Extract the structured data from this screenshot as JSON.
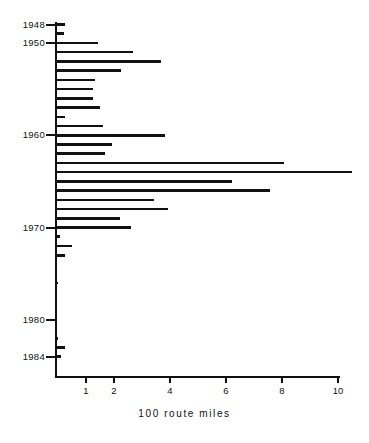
{
  "chart_data": {
    "type": "bar",
    "orientation": "horizontal",
    "title": "",
    "xlabel": "100 route miles",
    "ylabel": "",
    "xlim": [
      0,
      10.6
    ],
    "ylim": [
      1947.4,
      1984.8
    ],
    "grid": false,
    "legend": null,
    "x_ticks": [
      1,
      2,
      4,
      6,
      8,
      10
    ],
    "x_tick_labels": [
      "1",
      "2",
      "4",
      "6",
      "8",
      "10"
    ],
    "y_ticks": [
      1948,
      1950,
      1960,
      1970,
      1980,
      1984
    ],
    "y_tick_labels": [
      "1948",
      "1950",
      "1960",
      "1970",
      "1980",
      "1984"
    ],
    "categories": [
      1948,
      1949,
      1950,
      1951,
      1952,
      1953,
      1954,
      1955,
      1956,
      1957,
      1958,
      1959,
      1960,
      1961,
      1962,
      1963,
      1964,
      1965,
      1966,
      1967,
      1968,
      1969,
      1970,
      1971,
      1972,
      1973,
      1974,
      1975,
      1976,
      1977,
      1978,
      1979,
      1980,
      1981,
      1982,
      1983,
      1984
    ],
    "values": [
      0.3,
      0.25,
      1.45,
      2.7,
      3.7,
      2.3,
      1.35,
      1.3,
      1.3,
      1.55,
      0.3,
      1.65,
      3.85,
      1.95,
      1.7,
      8.1,
      10.55,
      6.25,
      7.6,
      3.45,
      3.95,
      2.25,
      2.65,
      0.1,
      0.55,
      0.3,
      0.0,
      0.0,
      0.05,
      0.0,
      0.0,
      0.0,
      0.0,
      0.0,
      0.05,
      0.3,
      0.15
    ],
    "series_name": "route miles abandoned",
    "units": "100 route miles",
    "bar_color": "#111111"
  },
  "axes": {
    "x_axis_title": "100 route miles"
  }
}
